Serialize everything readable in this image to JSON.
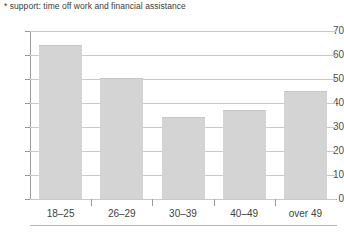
{
  "footnote": "* support: time off work and financial assistance",
  "chart_data": {
    "type": "bar",
    "title": "",
    "xlabel": "",
    "ylabel": "",
    "categories": [
      "18–25",
      "26–29",
      "30–39",
      "40–49",
      "over 49"
    ],
    "values": [
      64,
      50.5,
      34,
      37,
      45
    ],
    "ylim": [
      0,
      70
    ],
    "yticks": [
      0,
      10,
      20,
      30,
      40,
      50,
      60,
      70
    ],
    "ytick_labels": [
      "0",
      "10",
      "20",
      "30",
      "40",
      "50",
      "60",
      "70"
    ],
    "grid": true,
    "legend": false,
    "bar_color": "#d4d4d4",
    "grid_color": "#c9c9c9",
    "axis_color": "#9a9a9a"
  }
}
